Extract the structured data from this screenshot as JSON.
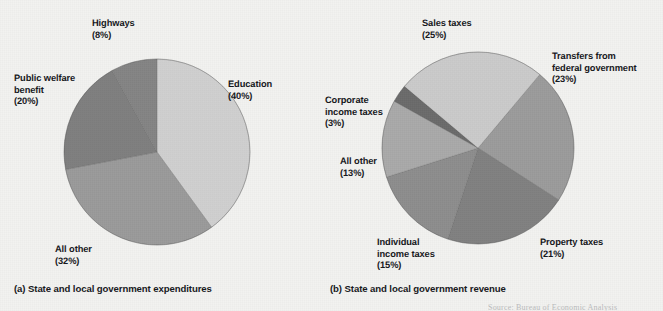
{
  "figure": {
    "background_color": "#f2f2f0",
    "source_note": "Source: Bureau of Economic Analysis"
  },
  "palette": {
    "lightest": "#d2d2d2",
    "light": "#c8c8c8",
    "mid_light": "#b6b6b6",
    "mid": "#9b9b9b",
    "mid_dark": "#8e8e8e",
    "dark": "#7d7d7d",
    "darkest": "#6e6e6e",
    "label_color": "#15161a"
  },
  "charts": [
    {
      "id": "expenditures",
      "caption": "(a) State and local government expenditures",
      "center": {
        "x": 157,
        "y": 152
      },
      "radius": 93,
      "start_angle": -90,
      "slices": [
        {
          "label": "Education",
          "pct_text": "(40%)",
          "value": 40,
          "color": "#cfcfcf"
        },
        {
          "label": "All other",
          "pct_text": "(32%)",
          "value": 32,
          "color": "#9a9a9a"
        },
        {
          "label": "Public welfare\nbenefit",
          "pct_text": "(20%)",
          "value": 20,
          "color": "#7e7e7e"
        },
        {
          "label": "Highways",
          "pct_text": "(8%)",
          "value": 8,
          "color": "#848484"
        }
      ]
    },
    {
      "id": "revenue",
      "caption": "(b) State and local government revenue",
      "center": {
        "x": 478,
        "y": 148
      },
      "radius": 96,
      "start_angle": -50,
      "slices": [
        {
          "label": "Transfers from\nfederal government",
          "pct_text": "(23%)",
          "value": 23,
          "color": "#9b9b9b"
        },
        {
          "label": "Property taxes",
          "pct_text": "(21%)",
          "value": 21,
          "color": "#808080"
        },
        {
          "label": "Individual\nincome taxes",
          "pct_text": "(15%)",
          "value": 15,
          "color": "#8d8d8d"
        },
        {
          "label": "All other",
          "pct_text": "(13%)",
          "value": 13,
          "color": "#a9a9a9"
        },
        {
          "label": "Corporate\nincome taxes",
          "pct_text": "(3%)",
          "value": 3,
          "color": "#6a6a6a"
        },
        {
          "label": "Sales taxes",
          "pct_text": "(25%)",
          "value": 25,
          "color": "#cacaca"
        }
      ]
    }
  ],
  "labels": {
    "a_highways": {
      "text": "Highways",
      "pct": "(8%)",
      "x": 92,
      "y": 7,
      "align": "left"
    },
    "a_public_welfare": {
      "text": "Public welfare\nbenefit",
      "pct": "(20%)",
      "x": 14,
      "y": 62,
      "align": "left"
    },
    "a_education": {
      "text": "Education",
      "pct": "(40%)",
      "x": 228,
      "y": 68,
      "align": "left"
    },
    "a_all_other": {
      "text": "All other",
      "pct": "(32%)",
      "x": 55,
      "y": 233,
      "align": "left"
    },
    "b_sales": {
      "text": "Sales taxes",
      "pct": "(25%)",
      "x": 422,
      "y": 7,
      "align": "left"
    },
    "b_transfers": {
      "text": "Transfers from\nfederal government",
      "pct": "(23%)",
      "x": 552,
      "y": 40,
      "align": "left"
    },
    "b_corporate": {
      "text": "Corporate\nincome taxes",
      "pct": "(3%)",
      "x": 325,
      "y": 84,
      "align": "left"
    },
    "b_all_other": {
      "text": "All other",
      "pct": "(13%)",
      "x": 340,
      "y": 145,
      "align": "left"
    },
    "b_individual": {
      "text": "Individual\nincome taxes",
      "pct": "(15%)",
      "x": 377,
      "y": 226,
      "align": "left"
    },
    "b_property": {
      "text": "Property taxes",
      "pct": "(21%)",
      "x": 540,
      "y": 226,
      "align": "left"
    }
  },
  "captions": {
    "a": {
      "text": "(a) State and local government expenditures",
      "x": 14,
      "y": 283
    },
    "b": {
      "text": "(b) State and local government revenue",
      "x": 330,
      "y": 283
    }
  },
  "chart_data": [
    {
      "type": "pie",
      "title": "(a) State and local government expenditures",
      "categories": [
        "Education",
        "All other",
        "Public welfare benefit",
        "Highways"
      ],
      "values": [
        40,
        32,
        20,
        8
      ],
      "unit": "percent",
      "labels": [
        "Education (40%)",
        "All other (32%)",
        "Public welfare benefit (20%)",
        "Highways (8%)"
      ],
      "colors": [
        "#cfcfcf",
        "#9a9a9a",
        "#7e7e7e",
        "#848484"
      ],
      "legend": "labels-outside",
      "grid": false
    },
    {
      "type": "pie",
      "title": "(b) State and local government revenue",
      "categories": [
        "Sales taxes",
        "Transfers from federal government",
        "Property taxes",
        "Individual income taxes",
        "All other",
        "Corporate income taxes"
      ],
      "values": [
        25,
        23,
        21,
        15,
        13,
        3
      ],
      "unit": "percent",
      "labels": [
        "Sales taxes (25%)",
        "Transfers from federal government (23%)",
        "Property taxes (21%)",
        "Individual income taxes (15%)",
        "All other (13%)",
        "Corporate income taxes (3%)"
      ],
      "colors": [
        "#cacaca",
        "#9b9b9b",
        "#808080",
        "#8d8d8d",
        "#a9a9a9",
        "#6a6a6a"
      ],
      "legend": "labels-outside",
      "grid": false
    }
  ]
}
